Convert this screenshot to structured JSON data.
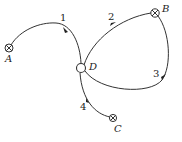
{
  "diagram": {
    "nodes": [
      {
        "id": "A",
        "label": "A",
        "type": "crossed-circle"
      },
      {
        "id": "B",
        "label": "B",
        "type": "crossed-circle"
      },
      {
        "id": "C",
        "label": "C",
        "type": "crossed-circle"
      },
      {
        "id": "D",
        "label": "D",
        "type": "open-circle"
      }
    ],
    "paths": [
      {
        "id": "1",
        "label": "1",
        "from": "A",
        "to": "D"
      },
      {
        "id": "2",
        "label": "2",
        "from": "D",
        "to": "B"
      },
      {
        "id": "3",
        "label": "3",
        "from": "B",
        "to": "D"
      },
      {
        "id": "4",
        "label": "4",
        "from": "C",
        "to": "D"
      }
    ],
    "colors": {
      "stroke": "#333333",
      "background": "#ffffff"
    }
  }
}
